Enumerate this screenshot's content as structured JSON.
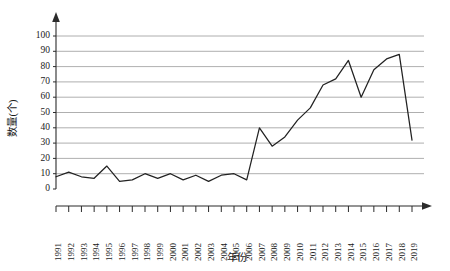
{
  "chart_data": {
    "type": "line",
    "title": "",
    "xlabel": "年份",
    "ylabel": "数量(个)",
    "xlim": [
      1991,
      2019
    ],
    "ylim": [
      0,
      100
    ],
    "ytick_step": 10,
    "grid": true,
    "legend": "none",
    "yticks": [
      0,
      10,
      20,
      30,
      40,
      50,
      60,
      70,
      80,
      90,
      100
    ],
    "categories": [
      "1991",
      "1992",
      "1993",
      "1994",
      "1995",
      "1996",
      "1997",
      "1998",
      "1999",
      "2000",
      "2001",
      "2002",
      "2003",
      "2004",
      "2005",
      "2006",
      "2007",
      "2008",
      "2009",
      "2010",
      "2011",
      "2012",
      "2013",
      "2014",
      "2015",
      "2016",
      "2017",
      "2018",
      "2019"
    ],
    "values": [
      8,
      11,
      8,
      7,
      15,
      5,
      6,
      10,
      7,
      10,
      6,
      9,
      5,
      9,
      10,
      6,
      40,
      28,
      34,
      45,
      53,
      68,
      72,
      84,
      60,
      78,
      85,
      88,
      32
    ],
    "series": [
      {
        "name": "数量(个)",
        "values": [
          8,
          11,
          8,
          7,
          15,
          5,
          6,
          10,
          7,
          10,
          6,
          9,
          5,
          9,
          10,
          6,
          40,
          28,
          34,
          45,
          53,
          68,
          72,
          84,
          60,
          78,
          85,
          88,
          32
        ]
      }
    ]
  },
  "axes": {
    "y_axis_title": "数量(个)",
    "x_axis_title": "年份"
  },
  "colors": {
    "line": "#222222",
    "grid": "#9a9a9a",
    "axis": "#2b2b2b",
    "background": "#ffffff"
  }
}
